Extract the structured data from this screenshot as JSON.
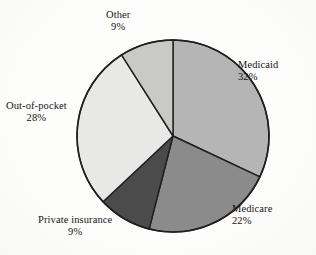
{
  "chart_data": {
    "type": "pie",
    "title": "",
    "subtitle": "",
    "xlabel": "",
    "ylabel": "",
    "legend_position": "none",
    "labels_inline": true,
    "start_angle_deg": 0,
    "direction": "clockwise",
    "categories": [
      "Medicaid",
      "Medicare",
      "Private insurance",
      "Out-of-pocket",
      "Other"
    ],
    "values": [
      32,
      22,
      9,
      28,
      9
    ],
    "value_unit": "%",
    "slices": [
      {
        "name": "Medicaid",
        "value": 32,
        "label": "Medicaid",
        "pct_label": "32%",
        "color": "#b5b5b5",
        "start_pct": 0,
        "end_pct": 32
      },
      {
        "name": "Medicare",
        "value": 22,
        "label": "Medicare",
        "pct_label": "22%",
        "color": "#8b8b8b",
        "start_pct": 32,
        "end_pct": 54
      },
      {
        "name": "Private insurance",
        "value": 9,
        "label": "Private insurance",
        "pct_label": "9%",
        "color": "#4b4b4b",
        "start_pct": 54,
        "end_pct": 63
      },
      {
        "name": "Out-of-pocket",
        "value": 28,
        "label": "Out-of-pocket",
        "pct_label": "28%",
        "color": "#e8e8e6",
        "start_pct": 63,
        "end_pct": 91
      },
      {
        "name": "Other",
        "value": 9,
        "label": "Other",
        "pct_label": "9%",
        "color": "#c9c9c7",
        "start_pct": 91,
        "end_pct": 100
      }
    ],
    "total": 100,
    "outline_color": "#1f1f1f",
    "background_color": "#fdfdfc"
  }
}
